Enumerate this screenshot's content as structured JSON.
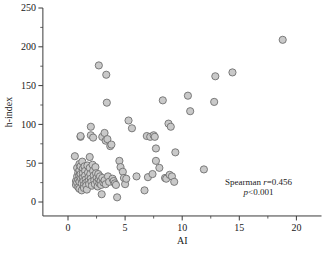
{
  "chart_data": {
    "type": "scatter",
    "title": "",
    "xlabel": "AI",
    "ylabel": "h-index",
    "xlim": [
      -2.2,
      22.2
    ],
    "ylim": [
      -18,
      250
    ],
    "xticks": [
      0,
      5,
      10,
      15,
      20
    ],
    "xtick_labels": [
      "0",
      "5",
      "10",
      "15",
      "20"
    ],
    "x_minor_ticks": [
      2.5,
      7.5,
      12.5,
      17.5
    ],
    "yticks": [
      0,
      50,
      100,
      150,
      200,
      250
    ],
    "ytick_labels": [
      "0",
      "50",
      "100",
      "150",
      "200",
      "250"
    ],
    "y_minor_ticks": [
      25,
      75,
      125,
      175,
      225
    ],
    "grid": false,
    "legend": null,
    "marker": {
      "shape": "circle",
      "fill_color": "#c9c9c9",
      "edge_color": "#6f6f6f",
      "radius_px": 3.6,
      "edge_width_px": 0.9
    },
    "annotations": [
      {
        "name": "spearman-r",
        "text": "Spearman r=0.456"
      },
      {
        "name": "p-value",
        "text": "p<0.001"
      }
    ],
    "annotation_parts": {
      "spearman_word": "Spearman ",
      "r_symbol": "r",
      "r_value": "=0.456",
      "p_symbol": "p",
      "p_value": "<0.001"
    },
    "points": [
      [
        0.6,
        59
      ],
      [
        0.7,
        27
      ],
      [
        0.7,
        22
      ],
      [
        0.8,
        44
      ],
      [
        0.8,
        33
      ],
      [
        0.8,
        25
      ],
      [
        0.9,
        38
      ],
      [
        0.9,
        29
      ],
      [
        0.9,
        19
      ],
      [
        1.0,
        49
      ],
      [
        1.0,
        41
      ],
      [
        1.0,
        34
      ],
      [
        1.0,
        26
      ],
      [
        1.0,
        17
      ],
      [
        1.1,
        84
      ],
      [
        1.1,
        85
      ],
      [
        1.1,
        46
      ],
      [
        1.1,
        36
      ],
      [
        1.15,
        30
      ],
      [
        1.2,
        24
      ],
      [
        1.2,
        15
      ],
      [
        1.25,
        52
      ],
      [
        1.3,
        43
      ],
      [
        1.3,
        37
      ],
      [
        1.3,
        31
      ],
      [
        1.35,
        27
      ],
      [
        1.4,
        22
      ],
      [
        1.4,
        18
      ],
      [
        1.45,
        46
      ],
      [
        1.5,
        40
      ],
      [
        1.5,
        34
      ],
      [
        1.55,
        29
      ],
      [
        1.6,
        25
      ],
      [
        1.6,
        21
      ],
      [
        1.65,
        16
      ],
      [
        1.7,
        47
      ],
      [
        1.75,
        38
      ],
      [
        1.8,
        32
      ],
      [
        1.8,
        27
      ],
      [
        1.85,
        23
      ],
      [
        1.9,
        58
      ],
      [
        1.9,
        44
      ],
      [
        1.95,
        36
      ],
      [
        2.0,
        97
      ],
      [
        2.0,
        86
      ],
      [
        2.0,
        30
      ],
      [
        2.05,
        26
      ],
      [
        2.1,
        21
      ],
      [
        2.15,
        48
      ],
      [
        2.2,
        83
      ],
      [
        2.2,
        40
      ],
      [
        2.25,
        34
      ],
      [
        2.3,
        28
      ],
      [
        2.35,
        23
      ],
      [
        2.4,
        45
      ],
      [
        2.45,
        37
      ],
      [
        2.5,
        31
      ],
      [
        2.55,
        26
      ],
      [
        2.6,
        20
      ],
      [
        2.65,
        36
      ],
      [
        2.7,
        176
      ],
      [
        2.7,
        29
      ],
      [
        2.75,
        24
      ],
      [
        2.8,
        33
      ],
      [
        2.85,
        27
      ],
      [
        2.9,
        22
      ],
      [
        2.95,
        10
      ],
      [
        3.0,
        84
      ],
      [
        3.0,
        31
      ],
      [
        3.1,
        25
      ],
      [
        3.2,
        89
      ],
      [
        3.2,
        28
      ],
      [
        3.3,
        79
      ],
      [
        3.3,
        23
      ],
      [
        3.35,
        164
      ],
      [
        3.4,
        128
      ],
      [
        3.45,
        81
      ],
      [
        3.5,
        33
      ],
      [
        3.6,
        26
      ],
      [
        3.7,
        72
      ],
      [
        3.8,
        74
      ],
      [
        3.9,
        30
      ],
      [
        4.0,
        27
      ],
      [
        4.1,
        24
      ],
      [
        4.2,
        22
      ],
      [
        4.3,
        6
      ],
      [
        4.5,
        53
      ],
      [
        4.6,
        45
      ],
      [
        4.8,
        39
      ],
      [
        4.9,
        31
      ],
      [
        5.0,
        23
      ],
      [
        5.1,
        30
      ],
      [
        5.3,
        105
      ],
      [
        5.6,
        95
      ],
      [
        6.0,
        33
      ],
      [
        6.7,
        15
      ],
      [
        6.9,
        85
      ],
      [
        7.0,
        32
      ],
      [
        7.2,
        84
      ],
      [
        7.4,
        36
      ],
      [
        7.5,
        86
      ],
      [
        7.6,
        84
      ],
      [
        7.7,
        69
      ],
      [
        7.7,
        53
      ],
      [
        8.0,
        44
      ],
      [
        8.3,
        131
      ],
      [
        8.5,
        31
      ],
      [
        8.6,
        30
      ],
      [
        8.8,
        101
      ],
      [
        8.9,
        35
      ],
      [
        9.0,
        97
      ],
      [
        9.1,
        33
      ],
      [
        9.3,
        26
      ],
      [
        9.4,
        64
      ],
      [
        10.5,
        137
      ],
      [
        10.7,
        117
      ],
      [
        11.9,
        42
      ],
      [
        12.8,
        129
      ],
      [
        12.9,
        162
      ],
      [
        14.4,
        167
      ],
      [
        18.8,
        209
      ]
    ]
  }
}
